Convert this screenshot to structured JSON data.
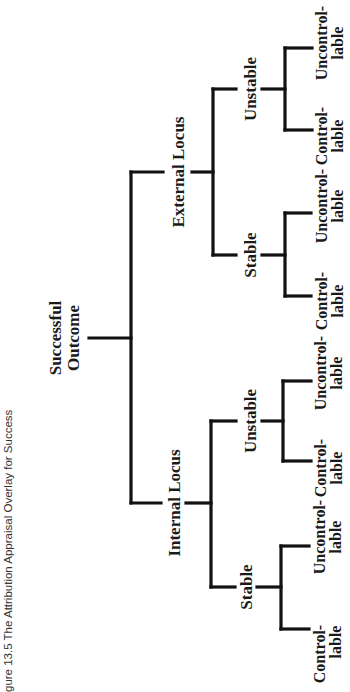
{
  "caption": "gure 13.5   The Attribution Appraisal Overlay for Success",
  "root": {
    "line1": "Successful",
    "line2": "Outcome"
  },
  "branches": {
    "internal": {
      "label": "Internal Locus",
      "stable": {
        "label": "Stable",
        "leaves": [
          {
            "line1": "Control-",
            "line2": "lable"
          },
          {
            "line1": "Uncontrol-",
            "line2": "lable"
          }
        ]
      },
      "unstable": {
        "label": "Unstable",
        "leaves": [
          {
            "line1": "Control-",
            "line2": "lable"
          },
          {
            "line1": "Uncontrol-",
            "line2": "lable"
          }
        ]
      }
    },
    "external": {
      "label": "External Locus",
      "stable": {
        "label": "Stable",
        "leaves": [
          {
            "line1": "Control-",
            "line2": "lable"
          },
          {
            "line1": "Uncontrol-",
            "line2": "lable"
          }
        ]
      },
      "unstable": {
        "label": "Unstable",
        "leaves": [
          {
            "line1": "Control-",
            "line2": "lable"
          },
          {
            "line1": "Uncontrol-",
            "line2": "lable"
          }
        ]
      }
    }
  },
  "colors": {
    "line": "#111111",
    "text": "#1a1a1a",
    "caption": "#333333",
    "background": "#ffffff"
  }
}
